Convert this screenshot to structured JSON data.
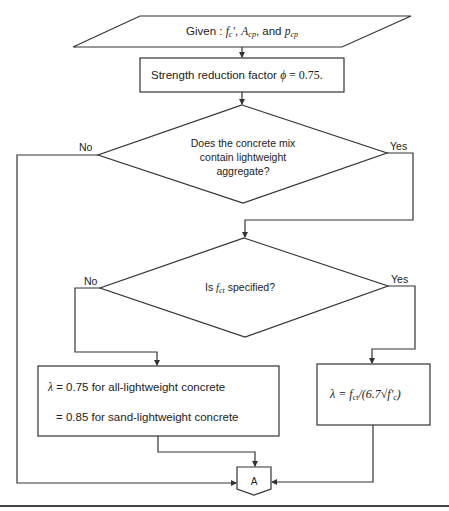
{
  "diagram": {
    "type": "flowchart",
    "colors": {
      "line": "#333333",
      "background": "#ffffff"
    },
    "input": {
      "prefix": "Given : ",
      "var1": "f",
      "var1_sub": "c",
      "var1_prime": "′",
      "sep1": ", ",
      "var2": "A",
      "var2_sub": "cp",
      "sep2": ", and ",
      "var3": "p",
      "var3_sub": "cp"
    },
    "step1": {
      "text_before": "Strength reduction factor ",
      "symbol": "ϕ",
      "text_after": " = 0.75."
    },
    "decision1": {
      "line1": "Does the concrete mix",
      "line2": "contain lightweight",
      "line3": "aggregate?",
      "no_label": "No",
      "yes_label": "Yes"
    },
    "decision2": {
      "prefix": "Is ",
      "var": "f",
      "var_sub": "ct",
      "suffix": " specified?",
      "no_label": "No",
      "yes_label": "Yes"
    },
    "box_left": {
      "line1_symbol": "λ",
      "line1_text": " = 0.75 for  all-lightweight concrete",
      "line2_text": "= 0.85 for sand-lightweight concrete"
    },
    "box_right": {
      "formula": "λ = f",
      "sub": "ct",
      "rest": "/(6.7√f′",
      "rest_sub": "c",
      "close": ")"
    },
    "connector": {
      "label": "A"
    }
  }
}
